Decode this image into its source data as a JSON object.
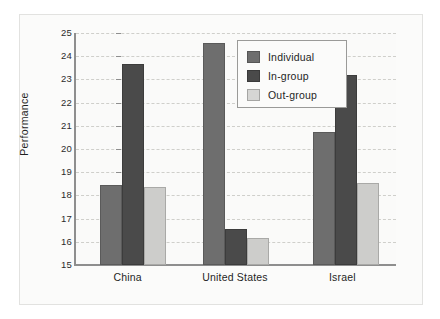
{
  "chart_data": {
    "type": "bar",
    "title": "",
    "xlabel": "",
    "ylabel": "Performance",
    "ylim": [
      15,
      25
    ],
    "yticks": [
      15,
      16,
      17,
      18,
      19,
      20,
      21,
      22,
      23,
      24,
      25
    ],
    "grid": true,
    "legend_position": "top-center",
    "categories": [
      "China",
      "United States",
      "Israel"
    ],
    "series": [
      {
        "name": "Individual",
        "color": "#6e6e6e",
        "values": [
          18.45,
          24.55,
          20.75
        ]
      },
      {
        "name": "In-group",
        "color": "#4a4a4a",
        "values": [
          23.65,
          16.55,
          23.2
        ]
      },
      {
        "name": "Out-group",
        "color": "#cdcdcb",
        "values": [
          18.35,
          16.15,
          18.55
        ]
      }
    ]
  },
  "axis": {
    "y_title": "Performance",
    "y_tick_labels": [
      "25",
      "24",
      "23",
      "22",
      "21",
      "20",
      "19",
      "18",
      "17",
      "16",
      "15"
    ],
    "x_tick_labels": [
      "China",
      "United States",
      "Israel"
    ]
  },
  "legend": {
    "entries": [
      {
        "label": "Individual",
        "color": "#6e6e6e"
      },
      {
        "label": "In-group",
        "color": "#4a4a4a"
      },
      {
        "label": "Out-group",
        "color": "#cdcdcb"
      }
    ]
  }
}
